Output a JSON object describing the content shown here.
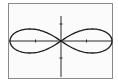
{
  "chart_data": {
    "type": "line",
    "title": "",
    "xlabel": "",
    "ylabel": "",
    "curve": "lemniscate",
    "equation": "r^2 = 4cos(2θ)",
    "parameter_a": 2,
    "xlim": [
      -2.06,
      2.06
    ],
    "ylim": [
      -2.2,
      2.2
    ],
    "x_ticks": [
      -1,
      1
    ],
    "y_ticks": [
      -1,
      1
    ],
    "grid": false,
    "legend": null,
    "series": [
      {
        "name": "lemniscate",
        "points": [
          [
            2.0,
            0.0
          ],
          [
            1.92,
            0.27
          ],
          [
            1.73,
            0.5
          ],
          [
            1.45,
            0.66
          ],
          [
            1.13,
            0.71
          ],
          [
            0.8,
            0.66
          ],
          [
            0.5,
            0.52
          ],
          [
            0.24,
            0.29
          ],
          [
            0.0,
            0.0
          ],
          [
            -0.24,
            -0.29
          ],
          [
            -0.5,
            -0.52
          ],
          [
            -0.8,
            -0.66
          ],
          [
            -1.13,
            -0.71
          ],
          [
            -1.45,
            -0.66
          ],
          [
            -1.73,
            -0.5
          ],
          [
            -1.92,
            -0.27
          ],
          [
            -2.0,
            0.0
          ],
          [
            -1.92,
            0.27
          ],
          [
            -1.73,
            0.5
          ],
          [
            -1.45,
            0.66
          ],
          [
            -1.13,
            0.71
          ],
          [
            -0.8,
            0.66
          ],
          [
            -0.5,
            0.52
          ],
          [
            -0.24,
            0.29
          ],
          [
            0.0,
            0.0
          ],
          [
            0.24,
            -0.29
          ],
          [
            0.5,
            -0.52
          ],
          [
            0.8,
            -0.66
          ],
          [
            1.13,
            -0.71
          ],
          [
            1.45,
            -0.66
          ],
          [
            1.73,
            -0.5
          ],
          [
            1.92,
            -0.27
          ],
          [
            2.0,
            0.0
          ]
        ]
      }
    ]
  },
  "colors": {
    "curve": "#1a1a1a",
    "axes": "#2a2a2a",
    "border": "#8a8a8a",
    "background": "#fbfbfb"
  }
}
